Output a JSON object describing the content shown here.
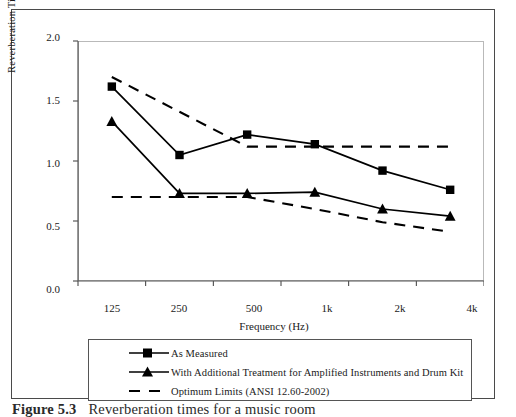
{
  "figure": {
    "caption_prefix": "Figure 5.3",
    "caption_text": "Reverberation times for a music room"
  },
  "chart_data": {
    "type": "line",
    "title": "",
    "xlabel": "Frequency (Hz)",
    "ylabel": "Reverberation Time (s)",
    "categories": [
      "125",
      "250",
      "500",
      "1k",
      "2k",
      "4k"
    ],
    "ylim": [
      0.0,
      2.0
    ],
    "yticks": [
      "0.0",
      "0.5",
      "1.0",
      "1.5",
      "2.0"
    ],
    "ytick_values": [
      0.0,
      0.5,
      1.0,
      1.5,
      2.0
    ],
    "grid": false,
    "legend_position": "below-plot",
    "series": [
      {
        "name": "As Measured",
        "marker": "square",
        "style": "solid",
        "values": [
          1.62,
          1.05,
          1.22,
          1.14,
          0.92,
          0.76
        ]
      },
      {
        "name": "With Additional Treatment for Amplified Instruments and Drum Kit",
        "marker": "triangle",
        "style": "solid",
        "values": [
          1.33,
          0.73,
          0.73,
          0.74,
          0.6,
          0.54
        ]
      },
      {
        "name": "Optimum Limits (ANSI 12.60-2002) upper",
        "marker": "none",
        "style": "dashed",
        "values": [
          1.7,
          1.41,
          1.12,
          1.12,
          1.12,
          1.12
        ]
      },
      {
        "name": "Optimum Limits (ANSI 12.60-2002) lower",
        "marker": "none",
        "style": "dashed",
        "values": [
          0.7,
          0.7,
          0.7,
          0.6,
          0.49,
          0.41
        ]
      }
    ]
  },
  "legend": {
    "items": [
      {
        "label": "As Measured",
        "marker": "square",
        "style": "solid"
      },
      {
        "label": "With Additional Treatment for Amplified Instruments and Drum Kit",
        "marker": "triangle",
        "style": "solid"
      },
      {
        "label": "Optimum Limits (ANSI 12.60-2002)",
        "marker": "none",
        "style": "dashed"
      }
    ]
  },
  "colors": {
    "line": "#000000",
    "frame": "#b9b9b9",
    "figure_border": "#4a4a4a",
    "background": "#ffffff"
  }
}
